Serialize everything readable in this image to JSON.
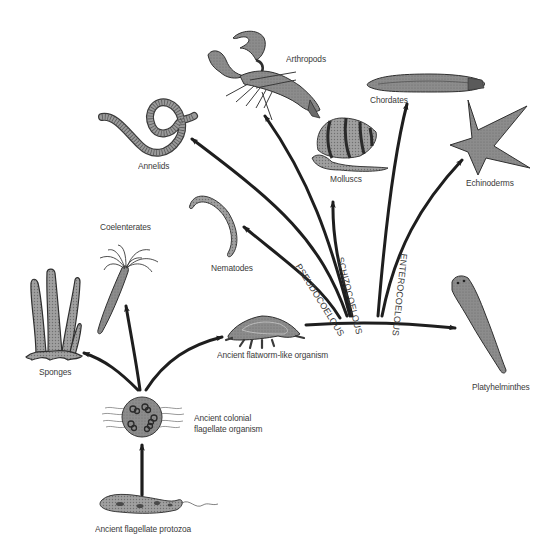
{
  "diagram": {
    "title": "",
    "nodes": {
      "arthropods": "Arthropods",
      "chordates": "Chordates",
      "annelids": "Annelids",
      "molluscs": "Molluscs",
      "echinoderms": "Echinoderms",
      "coelenterates": "Coelenterates",
      "nematodes": "Nematodes",
      "sponges": "Sponges",
      "flatworm_ancestor": "Ancient flatworm-like organism",
      "platyhelminthes": "Platyhelminthes",
      "colonial_flagellate_line1": "Ancient colonial",
      "colonial_flagellate_line2": "flagellate organism",
      "flagellate_protozoa": "Ancient flagellate protozoa"
    },
    "branch_labels": {
      "pseudocoelous": "PSEUDOCOELOUS",
      "schizocoelous": "SCHIZOCOELOUS",
      "enterocoelous": "ENTEROCOELOUS"
    },
    "edges": [
      {
        "from": "Ancient flagellate protozoa",
        "to": "Ancient colonial flagellate organism"
      },
      {
        "from": "Ancient colonial flagellate organism",
        "to": "Sponges"
      },
      {
        "from": "Ancient colonial flagellate organism",
        "to": "Coelenterates"
      },
      {
        "from": "Ancient colonial flagellate organism",
        "to": "Ancient flatworm-like organism"
      },
      {
        "from": "Ancient flatworm-like organism",
        "to": "Platyhelminthes"
      },
      {
        "from": "Ancient flatworm-like organism",
        "to": "Nematodes",
        "via": "PSEUDOCOELOUS"
      },
      {
        "from": "Ancient flatworm-like organism",
        "to": "Annelids",
        "via": "SCHIZOCOELOUS"
      },
      {
        "from": "Ancient flatworm-like organism",
        "to": "Arthropods",
        "via": "SCHIZOCOELOUS"
      },
      {
        "from": "Ancient flatworm-like organism",
        "to": "Molluscs",
        "via": "SCHIZOCOELOUS"
      },
      {
        "from": "Ancient flatworm-like organism",
        "to": "Chordates",
        "via": "ENTEROCOELOUS"
      },
      {
        "from": "Ancient flatworm-like organism",
        "to": "Echinoderms",
        "via": "ENTEROCOELOUS"
      }
    ],
    "colors": {
      "arrow": "#1e1e1e",
      "text": "#3a3a3a",
      "illustration_fill": "#8a8a8a",
      "illustration_dark": "#4a4a4a",
      "background": "#ffffff"
    }
  }
}
